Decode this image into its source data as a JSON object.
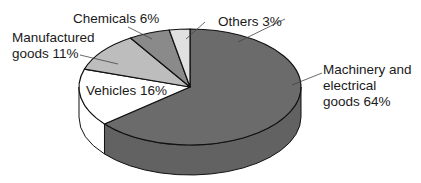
{
  "chart_data": {
    "type": "pie",
    "title": "",
    "style": "3d",
    "categories": [
      "Machinery and electrical goods",
      "Vehicles",
      "Manufactured goods",
      "Chemicals",
      "Others"
    ],
    "values": [
      64,
      16,
      11,
      6,
      3
    ],
    "unit": "%",
    "colors": [
      "#6b6b6b",
      "#ffffff",
      "#bdbdbd",
      "#8a8a8a",
      "#e0e0e0"
    ],
    "labels": [
      {
        "line1": "Machinery and",
        "line2": "electrical",
        "line3": "goods 64%"
      },
      {
        "line1": "Vehicles 16%"
      },
      {
        "line1": "Manufactured",
        "line2": "goods 11%"
      },
      {
        "line1": "Chemicals 6%"
      },
      {
        "line1": "Others 3%"
      }
    ]
  }
}
